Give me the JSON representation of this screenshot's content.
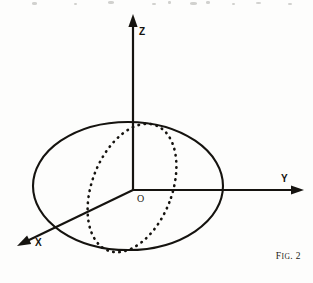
{
  "figure": {
    "caption_prefix": "F",
    "caption_smallcaps": "IG",
    "caption_suffix": ". 2",
    "caption_full": "FIG. 2",
    "background_color": "#fdfdfc",
    "ink_color": "#15130f"
  },
  "axes": {
    "z": {
      "label": "Z",
      "direction": "up",
      "tip": {
        "x": 133,
        "y": 16
      },
      "origin": {
        "x": 133,
        "y": 190
      },
      "label_pos": {
        "x": 139,
        "y": 27
      }
    },
    "y": {
      "label": "Y",
      "direction": "right",
      "tip": {
        "x": 302,
        "y": 190
      },
      "origin": {
        "x": 133,
        "y": 190
      },
      "label_pos": {
        "x": 281,
        "y": 178
      }
    },
    "x": {
      "label": "X",
      "direction": "down-left",
      "tip": {
        "x": 18,
        "y": 246
      },
      "origin": {
        "x": 133,
        "y": 190
      },
      "label_pos": {
        "x": 35,
        "y": 243
      }
    }
  },
  "origin": {
    "label": "O",
    "pos": {
      "x": 136,
      "y": 194
    }
  },
  "sphere": {
    "outline_style": "solid",
    "center": {
      "x": 128,
      "y": 186
    },
    "radius_x": 95,
    "radius_y": 64,
    "stroke_width": 2.1
  },
  "meridian": {
    "outline_style": "dotted",
    "center": {
      "x": 132,
      "y": 188
    },
    "radius_x": 40,
    "radius_y": 67,
    "rotation_deg": 21,
    "stroke_width": 2.6,
    "dash": "0.5 5.6"
  },
  "scan_artifacts": [
    {
      "x": 32,
      "y": 2,
      "w": 5,
      "h": 3
    },
    {
      "x": 74,
      "y": 3,
      "w": 3,
      "h": 2
    },
    {
      "x": 108,
      "y": 1,
      "w": 6,
      "h": 3
    },
    {
      "x": 152,
      "y": 3,
      "w": 4,
      "h": 2
    },
    {
      "x": 168,
      "y": 1,
      "w": 3,
      "h": 3
    },
    {
      "x": 190,
      "y": 2,
      "w": 7,
      "h": 3
    },
    {
      "x": 206,
      "y": 1,
      "w": 4,
      "h": 3
    },
    {
      "x": 232,
      "y": 3,
      "w": 3,
      "h": 2
    },
    {
      "x": 256,
      "y": 2,
      "w": 5,
      "h": 2
    },
    {
      "x": 288,
      "y": 3,
      "w": 4,
      "h": 2
    }
  ]
}
